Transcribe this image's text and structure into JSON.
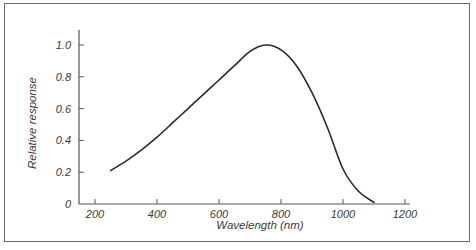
{
  "chart_data": {
    "type": "line",
    "title": "",
    "xlabel": "Wavelength (nm)",
    "ylabel": "Relative response",
    "xlim": [
      200,
      1200
    ],
    "ylim": [
      0,
      1.0
    ],
    "x_ticks": [
      200,
      400,
      600,
      800,
      1000,
      1200
    ],
    "x_tick_labels": [
      "200",
      "400",
      "600",
      "800",
      "1000",
      "1200"
    ],
    "y_ticks": [
      0,
      0.2,
      0.4,
      0.6,
      0.8,
      1.0
    ],
    "y_tick_labels": [
      "0",
      "0.2",
      "0.4",
      "0.6",
      "0.8",
      "1.0"
    ],
    "grid": false,
    "legend": null,
    "series": [
      {
        "name": "Relative response",
        "x": [
          250,
          300,
          350,
          400,
          450,
          500,
          550,
          600,
          650,
          700,
          750,
          800,
          850,
          900,
          950,
          1000,
          1050,
          1100
        ],
        "y": [
          0.21,
          0.27,
          0.34,
          0.42,
          0.51,
          0.6,
          0.69,
          0.78,
          0.87,
          0.96,
          1.0,
          0.97,
          0.87,
          0.7,
          0.48,
          0.22,
          0.08,
          0.01
        ]
      }
    ],
    "line_color": "#2a2a2a"
  },
  "axes": {
    "x_title": "Wavelength (nm)",
    "y_title": "Relative response"
  }
}
